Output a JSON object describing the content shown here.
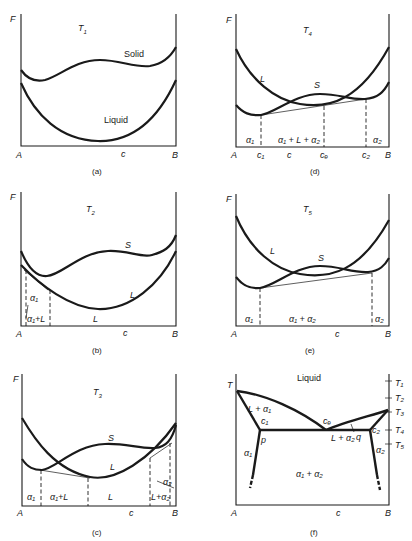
{
  "figure": {
    "panels": [
      {
        "id": "a",
        "caption": "(a)",
        "y_axis": "F",
        "temperature": "T",
        "temperature_sub": "1",
        "x_labels": {
          "left": "A",
          "middle": "c",
          "right": "B"
        },
        "curve_labels": {
          "solid": "Solid",
          "liquid": "Liquid"
        }
      },
      {
        "id": "b",
        "caption": "(b)",
        "y_axis": "F",
        "temperature": "T",
        "temperature_sub": "2",
        "x_labels": {
          "left": "A",
          "middle": "c",
          "right": "B"
        },
        "curve_labels": {
          "solid": "S",
          "liquid": "L"
        },
        "region_labels": {
          "alpha1": "α₁",
          "alpha1_plus_L": "α₁+L",
          "L": "L"
        }
      },
      {
        "id": "c",
        "caption": "(c)",
        "y_axis": "F",
        "temperature": "T",
        "temperature_sub": "3",
        "x_labels": {
          "left": "A",
          "middle": "c",
          "right": "B"
        },
        "curve_labels": {
          "solid": "S",
          "liquid": "L"
        },
        "region_labels": {
          "alpha1": "α₁",
          "alpha1_plus_L": "α₁+L",
          "L": "L",
          "L_plus_alpha2": "L+α₂",
          "alpha2": "α₂"
        }
      },
      {
        "id": "d",
        "caption": "(d)",
        "y_axis": "F",
        "temperature": "T",
        "temperature_sub": "4",
        "x_labels": {
          "left": "A",
          "c1": "c₁",
          "middle": "c",
          "ce": "cₑ",
          "c2": "c₂",
          "right": "B"
        },
        "curve_labels": {
          "solid": "S",
          "liquid": "L"
        },
        "region_labels": {
          "alpha1": "α₁",
          "three_phase": "α₁ + L + α₂",
          "alpha2": "α₂"
        }
      },
      {
        "id": "e",
        "caption": "(e)",
        "y_axis": "F",
        "temperature": "T",
        "temperature_sub": "5",
        "x_labels": {
          "left": "A",
          "middle": "c",
          "right": "B"
        },
        "curve_labels": {
          "solid": "S",
          "liquid": "L"
        },
        "region_labels": {
          "alpha1": "α₁",
          "alpha1_plus_alpha2": "α₁ + α₂",
          "alpha2": "α₂"
        }
      },
      {
        "id": "f",
        "caption": "(f)",
        "y_axis": "T",
        "x_labels": {
          "left": "A",
          "middle": "c",
          "right": "B"
        },
        "temperature_ticks": [
          "T₁",
          "T₂",
          "T₃",
          "T₄",
          "T₅"
        ],
        "region_labels": {
          "liquid": "Liquid",
          "L_plus_alpha1": "L + α₁",
          "c1": "c₁",
          "ce": "cₑ",
          "c2": "c₂",
          "p": "p",
          "q": "q",
          "L_plus_alpha2": "L + α₂",
          "alpha1": "α₁",
          "alpha2": "α₂",
          "alpha1_plus_alpha2": "α₁ + α₂"
        }
      }
    ]
  }
}
